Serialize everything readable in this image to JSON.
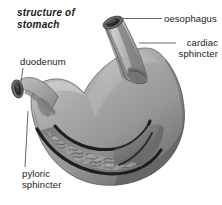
{
  "figure": {
    "title": "structure of\nstomach",
    "background_color": "#ffffff",
    "text_color": "#1a1a1a",
    "organ_fill": "#9d9d9d",
    "organ_shadow": "#6f6f6f",
    "organ_highlight": "#c9c9c9",
    "interior_dark": "#4a4a4a",
    "rugae_color": "#8c8c8c",
    "outline_color": "#2b2b2b",
    "leader_color": "#555555"
  },
  "labels": [
    {
      "id": "oesophagus",
      "text": "oesophagus",
      "leader": "horizontal"
    },
    {
      "id": "cardiac-sphincter",
      "text": "cardiac\nsphincter",
      "leader": "horizontal"
    },
    {
      "id": "duodenum",
      "text": "duodenum",
      "leader": "vertical"
    },
    {
      "id": "pyloric-sphincter",
      "text": "pyloric\nsphincter",
      "leader": "vertical"
    }
  ],
  "diagram_parts": [
    "oesophagus",
    "cardiac sphincter",
    "fundus",
    "body",
    "rugae",
    "pyloric sphincter",
    "duodenum"
  ]
}
